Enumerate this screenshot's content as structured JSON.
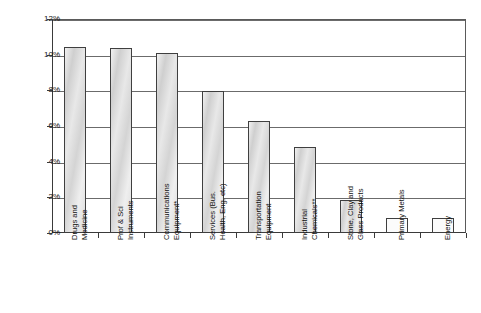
{
  "chart_data": {
    "type": "bar",
    "title": "",
    "xlabel": "",
    "ylabel": "R&D as % of Net Sales",
    "ylim": [
      0,
      12
    ],
    "ytick_labels": [
      "0%",
      "2%",
      "4%",
      "6%",
      "8%",
      "10%",
      "12%"
    ],
    "ytick_values": [
      0,
      2,
      4,
      6,
      8,
      10,
      12
    ],
    "grid": true,
    "legend": "none",
    "units": "percent",
    "categories": [
      "Drugs and\nMedicine",
      "Prof & Sci\nInstruments",
      "Communications\nEquipment*",
      "Services (Bus.\nHealth, Eng. etc)",
      "Transportation\nEquipment",
      "Industrial\nChemicals**",
      "Stone, Clay and\nGlass Products",
      "Primary Metals",
      "Energy"
    ],
    "values": [
      10.45,
      10.35,
      10.1,
      7.95,
      6.3,
      4.85,
      1.85,
      0.85,
      0.85
    ]
  }
}
